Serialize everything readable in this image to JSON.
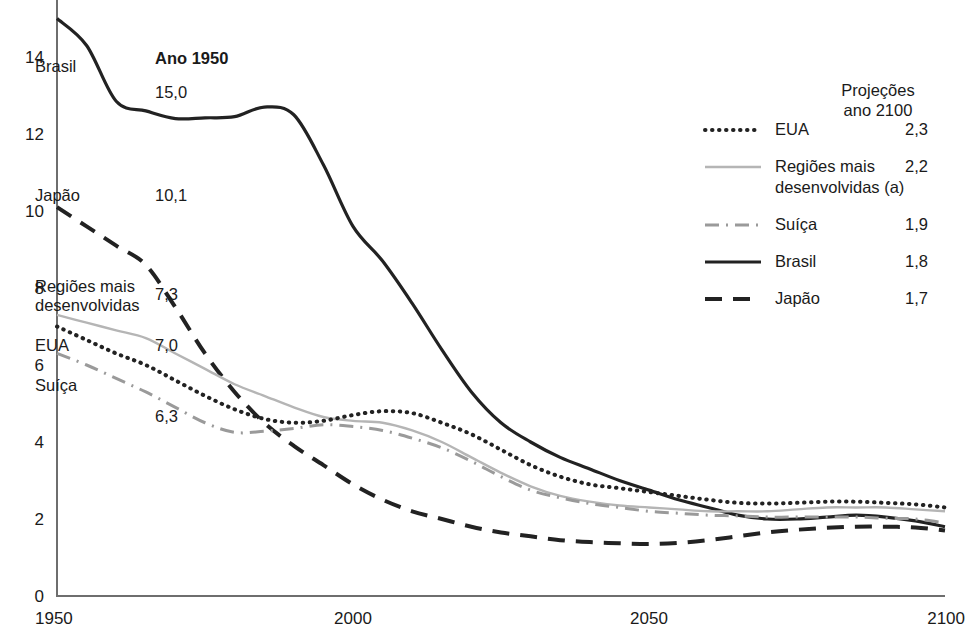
{
  "chart_data": {
    "type": "line",
    "title": "",
    "xlabel": "",
    "ylabel": "",
    "xlim": [
      1950,
      2100
    ],
    "ylim": [
      0,
      15.5
    ],
    "xticks": [
      "1950",
      "2000",
      "2050",
      "2100"
    ],
    "yticks": [
      "0",
      "2",
      "4",
      "6",
      "8",
      "10",
      "12",
      "14"
    ],
    "grid": false,
    "legend_position": "right",
    "x": [
      1950,
      1955,
      1960,
      1965,
      1970,
      1975,
      1980,
      1985,
      1990,
      1995,
      2000,
      2005,
      2010,
      2015,
      2020,
      2025,
      2030,
      2035,
      2040,
      2045,
      2050,
      2055,
      2060,
      2065,
      2070,
      2075,
      2080,
      2085,
      2090,
      2095,
      2100
    ],
    "series": [
      {
        "name": "Brasil",
        "style": "solid",
        "color": "#222222",
        "values": [
          15.0,
          14.3,
          12.85,
          12.6,
          12.4,
          12.42,
          12.45,
          12.7,
          12.5,
          11.2,
          9.6,
          8.7,
          7.6,
          6.4,
          5.3,
          4.5,
          4.0,
          3.6,
          3.3,
          3.0,
          2.75,
          2.5,
          2.3,
          2.1,
          2.0,
          2.0,
          2.05,
          2.1,
          2.05,
          1.95,
          1.8
        ]
      },
      {
        "name": "Japão",
        "style": "dashed",
        "color": "#222222",
        "values": [
          10.1,
          9.6,
          9.1,
          8.6,
          7.5,
          6.3,
          5.3,
          4.5,
          3.9,
          3.4,
          2.9,
          2.5,
          2.2,
          2.0,
          1.8,
          1.65,
          1.55,
          1.45,
          1.4,
          1.37,
          1.35,
          1.38,
          1.45,
          1.55,
          1.65,
          1.72,
          1.77,
          1.8,
          1.8,
          1.78,
          1.7
        ]
      },
      {
        "name": "Regiões mais desenvolvidas (a)",
        "style": "solid-light",
        "color": "#b5b5b5",
        "values": [
          7.3,
          7.1,
          6.9,
          6.7,
          6.3,
          5.9,
          5.5,
          5.2,
          4.9,
          4.65,
          4.55,
          4.5,
          4.3,
          4.0,
          3.6,
          3.2,
          2.85,
          2.6,
          2.45,
          2.35,
          2.3,
          2.25,
          2.2,
          2.2,
          2.2,
          2.25,
          2.3,
          2.3,
          2.3,
          2.25,
          2.2
        ]
      },
      {
        "name": "EUA",
        "style": "dotted",
        "color": "#222222",
        "values": [
          7.0,
          6.65,
          6.3,
          6.0,
          5.6,
          5.2,
          4.85,
          4.6,
          4.5,
          4.55,
          4.7,
          4.8,
          4.75,
          4.5,
          4.2,
          3.8,
          3.4,
          3.1,
          2.9,
          2.8,
          2.7,
          2.6,
          2.5,
          2.42,
          2.4,
          2.42,
          2.45,
          2.45,
          2.42,
          2.38,
          2.3
        ]
      },
      {
        "name": "Suíça",
        "style": "dashdot",
        "color": "#9a9a9a",
        "values": [
          6.3,
          6.0,
          5.65,
          5.3,
          4.9,
          4.5,
          4.25,
          4.28,
          4.35,
          4.45,
          4.4,
          4.3,
          4.1,
          3.85,
          3.5,
          3.1,
          2.75,
          2.55,
          2.4,
          2.3,
          2.2,
          2.15,
          2.1,
          2.08,
          2.05,
          2.05,
          2.05,
          2.05,
          2.02,
          2.0,
          1.9
        ]
      }
    ]
  },
  "annotations": {
    "year_header": "Ano 1950",
    "series_left_labels": [
      {
        "name": "Brasil",
        "label": "Brasil",
        "value": "15,0"
      },
      {
        "name": "Japão",
        "label": "Japão",
        "value": "10,1"
      },
      {
        "name": "Regiões mais desenvolvidas",
        "label_line1": "Regiões mais",
        "label_line2": "desenvolvidas",
        "value": "7,3"
      },
      {
        "name": "EUA",
        "label": "EUA",
        "value": "7,0"
      },
      {
        "name": "Suíça",
        "label": "Suíça",
        "value": "6,3"
      }
    ]
  },
  "legend": {
    "header_line1": "Projeções",
    "header_line2": "ano 2100",
    "items": [
      {
        "label": "EUA",
        "value": "2,3",
        "style": "dotted"
      },
      {
        "label_line1": "Regiões mais",
        "label_line2": "desenvolvidas (a)",
        "value": "2,2",
        "style": "solid-light"
      },
      {
        "label": "Suíça",
        "value": "1,9",
        "style": "dashdot"
      },
      {
        "label": "Brasil",
        "value": "1,8",
        "style": "solid"
      },
      {
        "label": "Japão",
        "value": "1,7",
        "style": "dashed"
      }
    ]
  },
  "axis": {
    "xticks": [
      "1950",
      "2000",
      "2050",
      "2100"
    ],
    "yticks": [
      "14",
      "12",
      "10",
      "8",
      "6",
      "4",
      "2",
      "0"
    ]
  },
  "colors": {
    "brasil": "#222222",
    "japao": "#222222",
    "regioes": "#b5b5b5",
    "eua": "#222222",
    "suica": "#9a9a9a",
    "axis": "#6e6e6e",
    "text": "#1a1a1a"
  }
}
